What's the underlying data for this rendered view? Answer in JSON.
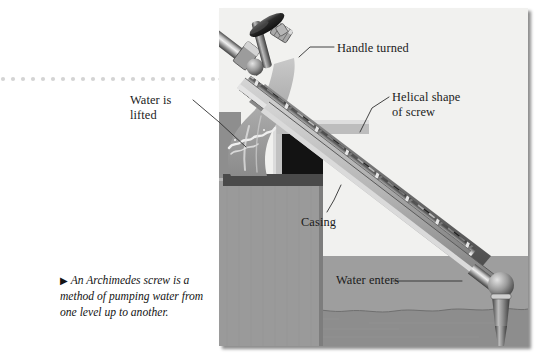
{
  "figure": {
    "type": "technical-illustration",
    "subject": "Archimedes screw",
    "caption_marker": "▶",
    "caption": "An Archimedes screw is a method of pumping water from one level up to another."
  },
  "labels": {
    "handle": "Handle turned",
    "water_lifted_line1": "Water is",
    "water_lifted_line2": "lifted",
    "helical_line1": "Helical shape",
    "helical_line2": "of screw",
    "casing": "Casing",
    "water_enters": "Water enters"
  },
  "colors": {
    "page_background": "#ffffff",
    "panel_background": "#f1f1ef",
    "dotted_rule": "#d3d3d3",
    "text": "#1b1b1b",
    "leader_line": "#3a3a3a",
    "ground": "#9a9a9a",
    "masonry": "#989898",
    "water": "#a9a9a9",
    "casing_gray": "#8c8c8c",
    "casing_dark": "#5c5c5c",
    "interior_shadow": "#171717",
    "metal_light": "#e2e2e2",
    "metal_mid": "#9d9d9d",
    "metal_dark": "#4a4a4a"
  },
  "panel": {
    "x": 219,
    "y": 8,
    "width": 309,
    "height": 338
  },
  "parts": [
    "crank handle",
    "crank arm",
    "ball bearing",
    "drive shaft",
    "helical screw blade",
    "cutaway casing",
    "discharge trough",
    "masonry pier",
    "lower water reservoir",
    "pivot post"
  ]
}
